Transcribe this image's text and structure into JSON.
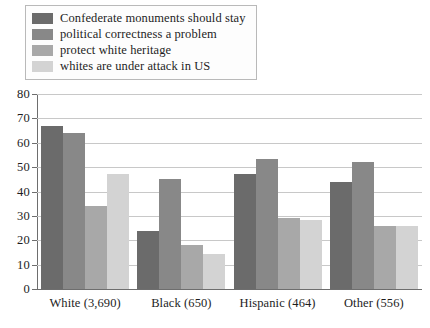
{
  "chart_data": {
    "type": "bar",
    "title": "",
    "xlabel": "",
    "ylabel": "",
    "ylim": [
      0,
      80
    ],
    "yticks": [
      "0",
      "10",
      "20",
      "30",
      "40",
      "50",
      "60",
      "70",
      "80"
    ],
    "ytick_values": [
      0,
      10,
      20,
      30,
      40,
      50,
      60,
      70,
      80
    ],
    "grid": true,
    "legend_position": "top-left",
    "categories": [
      "White (3,690)",
      "Black (650)",
      "Hispanic (464)",
      "Other (556)"
    ],
    "series": [
      {
        "name": "Confederate monuments should stay",
        "color": "#6b6b6b",
        "values": [
          67,
          24,
          47,
          44
        ]
      },
      {
        "name": "political correctness a problem",
        "color": "#888888",
        "values": [
          64,
          45,
          53.5,
          52
        ]
      },
      {
        "name": "protect white heritage",
        "color": "#a8a8a8",
        "values": [
          34,
          18,
          29,
          26
        ]
      },
      {
        "name": "whites are under attack in US",
        "color": "#d3d3d3",
        "values": [
          47,
          14.5,
          28.5,
          26
        ]
      }
    ]
  }
}
